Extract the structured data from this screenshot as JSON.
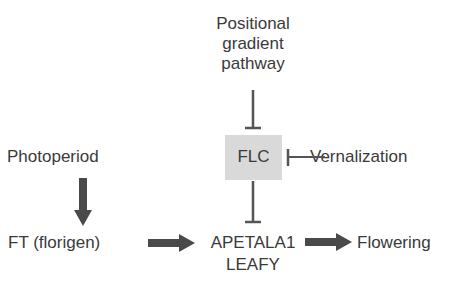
{
  "diagram": {
    "nodes": {
      "positional": {
        "lines": [
          "Positional",
          "gradient",
          "pathway"
        ]
      },
      "flc": {
        "label": "FLC",
        "fill": "#d9d9d9"
      },
      "vernalization": {
        "label": "Vernalization"
      },
      "photoperiod": {
        "label": "Photoperiod"
      },
      "ft": {
        "label": "FT (florigen)"
      },
      "apetala": {
        "lines": [
          "APETALA1",
          "LEAFY"
        ]
      },
      "flowering": {
        "label": "Flowering"
      }
    },
    "edges": [
      {
        "from": "positional",
        "to": "flc",
        "type": "inhibition"
      },
      {
        "from": "vernalization",
        "to": "flc",
        "type": "inhibition"
      },
      {
        "from": "flc",
        "to": "apetala",
        "type": "inhibition"
      },
      {
        "from": "photoperiod",
        "to": "ft",
        "type": "activation"
      },
      {
        "from": "ft",
        "to": "apetala",
        "type": "activation"
      },
      {
        "from": "apetala",
        "to": "flowering",
        "type": "activation"
      }
    ],
    "colors": {
      "text": "#3a3a3a",
      "line": "#555555",
      "arrow": "#4a4a4a",
      "box": "#d9d9d9"
    }
  }
}
